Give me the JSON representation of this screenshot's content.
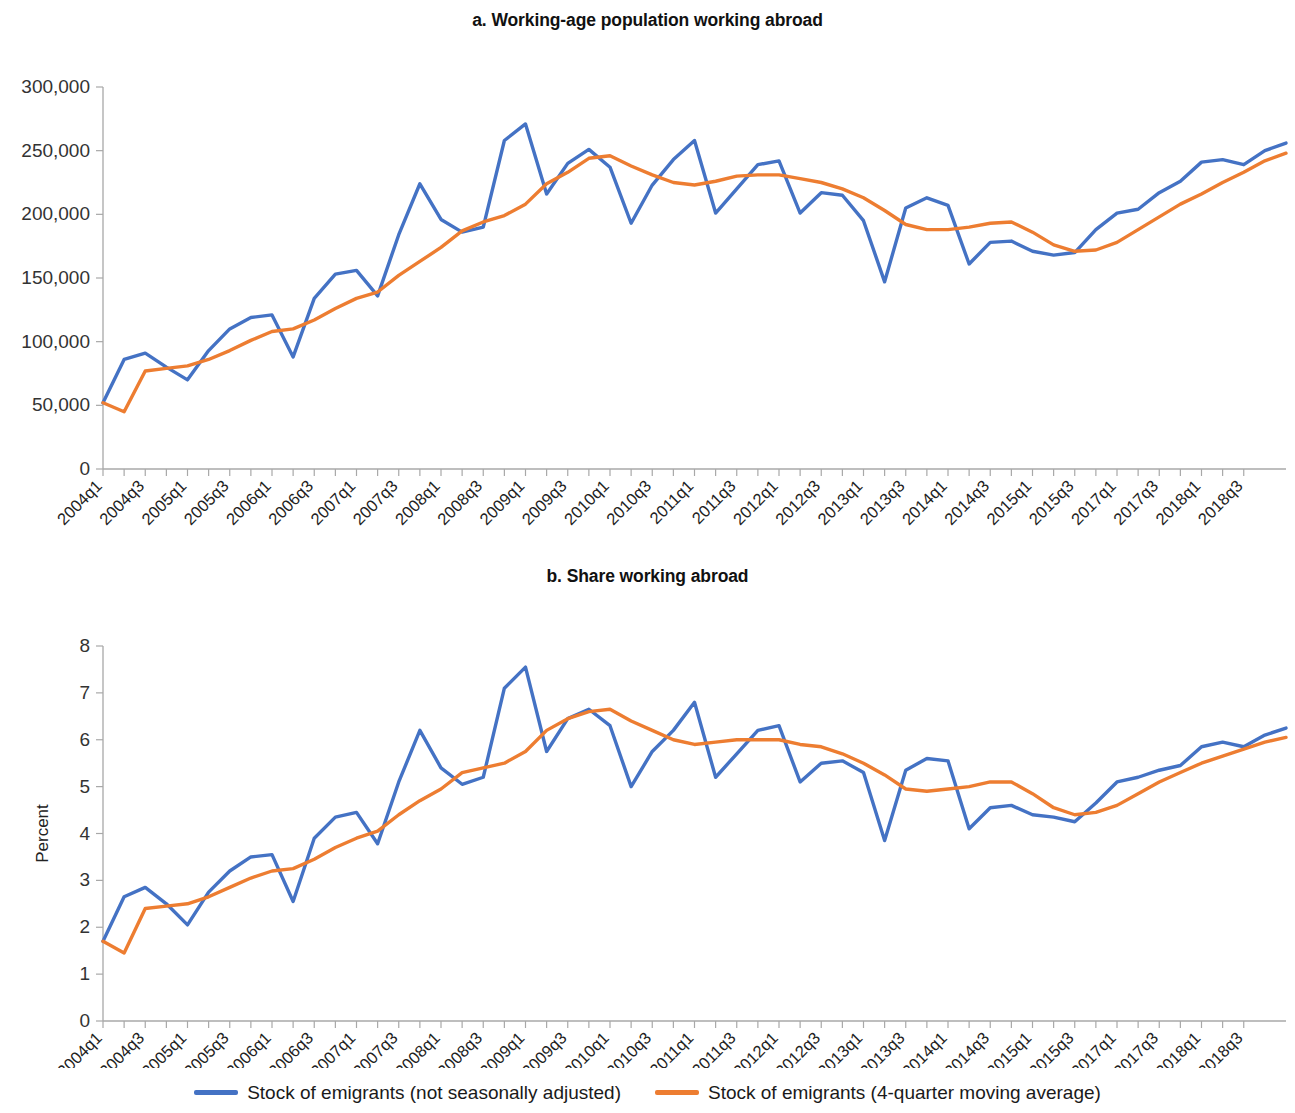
{
  "figure": {
    "legend": [
      {
        "name": "series-not-seasonally-adjusted",
        "label": "Stock of emigrants (not seasonally adjusted)",
        "color": "#4472c4"
      },
      {
        "name": "series-moving-average",
        "label": "Stock of emigrants (4-quarter moving average)",
        "color": "#ed7d31"
      }
    ]
  },
  "chart_data": [
    {
      "type": "line",
      "name": "panel-a",
      "title": "a. Working-age population working abroad",
      "xlabel": "",
      "ylabel": "",
      "ylim": [
        0,
        300000
      ],
      "yticks": [
        0,
        50000,
        100000,
        150000,
        200000,
        250000,
        300000
      ],
      "ytick_labels": [
        "0",
        "50,000",
        "100,000",
        "150,000",
        "200,000",
        "250,000",
        "300,000"
      ],
      "grid": false,
      "legend_position": "bottom",
      "x": [
        "2004q1",
        "2004q2",
        "2004q3",
        "2004q4",
        "2005q1",
        "2005q2",
        "2005q3",
        "2005q4",
        "2006q1",
        "2006q2",
        "2006q3",
        "2006q4",
        "2007q1",
        "2007q2",
        "2007q3",
        "2007q4",
        "2008q1",
        "2008q2",
        "2008q3",
        "2008q4",
        "2009q1",
        "2009q2",
        "2009q3",
        "2009q4",
        "2010q1",
        "2010q2",
        "2010q3",
        "2010q4",
        "2011q1",
        "2011q2",
        "2011q3",
        "2011q4",
        "2012q1",
        "2012q2",
        "2012q3",
        "2012q4",
        "2013q1",
        "2013q2",
        "2013q3",
        "2013q4",
        "2014q1",
        "2014q2",
        "2014q3",
        "2014q4",
        "2015q1",
        "2015q2",
        "2015q3",
        "2015q4",
        "2017q1",
        "2017q2",
        "2017q3",
        "2017q4",
        "2018q1",
        "2018q2",
        "2018q3"
      ],
      "xtick_labels": [
        "2004q1",
        "2004q3",
        "2005q1",
        "2005q3",
        "2006q1",
        "2006q3",
        "2007q1",
        "2007q3",
        "2008q1",
        "2008q3",
        "2009q1",
        "2009q3",
        "2010q1",
        "2010q3",
        "2011q1",
        "2011q3",
        "2012q1",
        "2012q3",
        "2013q1",
        "2013q3",
        "2014q1",
        "2014q3",
        "2015q1",
        "2015q3",
        "2017q1",
        "2017q3",
        "2018q1",
        "2018q3"
      ],
      "series": [
        {
          "name": "Stock of emigrants (not seasonally adjusted)",
          "color": "#4472c4",
          "values": [
            52000,
            86000,
            91000,
            80000,
            70000,
            93000,
            110000,
            119000,
            121000,
            88000,
            134000,
            153000,
            156000,
            136000,
            184000,
            224000,
            196000,
            186000,
            190000,
            258000,
            271000,
            216000,
            240000,
            251000,
            237000,
            193000,
            223000,
            243000,
            258000,
            201000,
            220000,
            239000,
            242000,
            201000,
            217000,
            215000,
            195000,
            147000,
            205000,
            213000,
            207000,
            161000,
            178000,
            179000,
            171000,
            168000,
            170000,
            188000,
            201000,
            204000,
            217000,
            226000,
            241000,
            243000,
            239000,
            250000,
            256000
          ]
        },
        {
          "name": "Stock of emigrants (4-quarter moving average)",
          "color": "#ed7d31",
          "values": [
            52000,
            45000,
            77000,
            79000,
            81000,
            86000,
            93000,
            101000,
            108000,
            110000,
            117000,
            126000,
            134000,
            139000,
            152000,
            163000,
            174000,
            187000,
            194000,
            199000,
            208000,
            224000,
            233000,
            244000,
            246000,
            238000,
            231000,
            225000,
            223000,
            226000,
            230000,
            231000,
            231000,
            228000,
            225000,
            220000,
            213000,
            203000,
            192000,
            188000,
            188000,
            190000,
            193000,
            194000,
            186000,
            176000,
            171000,
            172000,
            178000,
            188000,
            198000,
            208000,
            216000,
            225000,
            233000,
            242000,
            248000
          ]
        }
      ]
    },
    {
      "type": "line",
      "name": "panel-b",
      "title": "b. Share working abroad",
      "xlabel": "",
      "ylabel": "Percent",
      "ylim": [
        0,
        8
      ],
      "yticks": [
        0,
        1,
        2,
        3,
        4,
        5,
        6,
        7,
        8
      ],
      "ytick_labels": [
        "0",
        "1",
        "2",
        "3",
        "4",
        "5",
        "6",
        "7",
        "8"
      ],
      "grid": false,
      "legend_position": "bottom",
      "x": [
        "2004q1",
        "2004q2",
        "2004q3",
        "2004q4",
        "2005q1",
        "2005q2",
        "2005q3",
        "2005q4",
        "2006q1",
        "2006q2",
        "2006q3",
        "2006q4",
        "2007q1",
        "2007q2",
        "2007q3",
        "2007q4",
        "2008q1",
        "2008q2",
        "2008q3",
        "2008q4",
        "2009q1",
        "2009q2",
        "2009q3",
        "2009q4",
        "2010q1",
        "2010q2",
        "2010q3",
        "2010q4",
        "2011q1",
        "2011q2",
        "2011q3",
        "2011q4",
        "2012q1",
        "2012q2",
        "2012q3",
        "2012q4",
        "2013q1",
        "2013q2",
        "2013q3",
        "2013q4",
        "2014q1",
        "2014q2",
        "2014q3",
        "2014q4",
        "2015q1",
        "2015q2",
        "2015q3",
        "2015q4",
        "2017q1",
        "2017q2",
        "2017q3",
        "2017q4",
        "2018q1",
        "2018q2",
        "2018q3"
      ],
      "xtick_labels": [
        "2004q1",
        "2004q3",
        "2005q1",
        "2005q3",
        "2006q1",
        "2006q3",
        "2007q1",
        "2007q3",
        "2008q1",
        "2008q3",
        "2009q1",
        "2009q3",
        "2010q1",
        "2010q3",
        "2011q1",
        "2011q3",
        "2012q1",
        "2012q3",
        "2013q1",
        "2013q3",
        "2014q1",
        "2014q3",
        "2015q1",
        "2015q3",
        "2017q1",
        "2017q3",
        "2018q1",
        "2018q3"
      ],
      "series": [
        {
          "name": "Stock of emigrants (not seasonally adjusted)",
          "color": "#4472c4",
          "values": [
            1.7,
            2.65,
            2.85,
            2.5,
            2.05,
            2.75,
            3.2,
            3.5,
            3.55,
            2.55,
            3.9,
            4.35,
            4.45,
            3.78,
            5.1,
            6.2,
            5.4,
            5.05,
            5.2,
            7.1,
            7.55,
            5.75,
            6.45,
            6.65,
            6.3,
            5.0,
            5.75,
            6.2,
            6.8,
            5.2,
            5.7,
            6.2,
            6.3,
            5.1,
            5.5,
            5.55,
            5.3,
            3.85,
            5.35,
            5.6,
            5.55,
            4.1,
            4.55,
            4.6,
            4.4,
            4.35,
            4.25,
            4.65,
            5.1,
            5.2,
            5.35,
            5.45,
            5.85,
            5.95,
            5.85,
            6.1,
            6.25
          ]
        },
        {
          "name": "Stock of emigrants (4-quarter moving average)",
          "color": "#ed7d31",
          "values": [
            1.7,
            1.45,
            2.4,
            2.45,
            2.5,
            2.65,
            2.85,
            3.05,
            3.2,
            3.25,
            3.45,
            3.7,
            3.9,
            4.05,
            4.4,
            4.7,
            4.95,
            5.3,
            5.4,
            5.5,
            5.75,
            6.2,
            6.45,
            6.6,
            6.65,
            6.4,
            6.2,
            6.0,
            5.9,
            5.95,
            6.0,
            6.0,
            6.0,
            5.9,
            5.85,
            5.7,
            5.5,
            5.25,
            4.95,
            4.9,
            4.95,
            5.0,
            5.1,
            5.1,
            4.85,
            4.55,
            4.4,
            4.45,
            4.6,
            4.85,
            5.1,
            5.3,
            5.5,
            5.65,
            5.8,
            5.95,
            6.05
          ]
        }
      ]
    }
  ]
}
